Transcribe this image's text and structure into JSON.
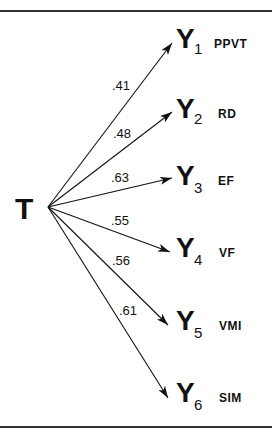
{
  "diagram": {
    "type": "path-diagram",
    "source": {
      "id": "T",
      "label": "T"
    },
    "targets": [
      {
        "id": "Y1",
        "label": "Y",
        "subscript": "1",
        "tag": "PPVT",
        "loading": ".41"
      },
      {
        "id": "Y2",
        "label": "Y",
        "subscript": "2",
        "tag": "RD",
        "loading": ".48"
      },
      {
        "id": "Y3",
        "label": "Y",
        "subscript": "3",
        "tag": "EF",
        "loading": ".63"
      },
      {
        "id": "Y4",
        "label": "Y",
        "subscript": "4",
        "tag": "VF",
        "loading": ".55"
      },
      {
        "id": "Y5",
        "label": "Y",
        "subscript": "5",
        "tag": "VMI",
        "loading": ".56"
      },
      {
        "id": "Y6",
        "label": "Y",
        "subscript": "6",
        "tag": "SIM",
        "loading": ".61"
      }
    ]
  }
}
